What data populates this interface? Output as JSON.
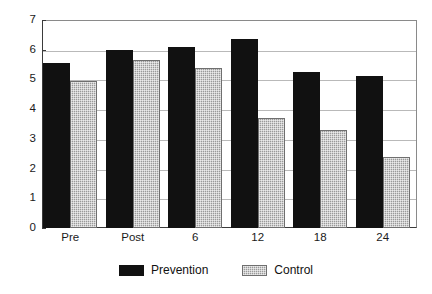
{
  "chart_data": {
    "type": "bar",
    "title": "",
    "subtitle": "",
    "xlabel": "",
    "ylabel": "",
    "categories": [
      "Pre",
      "Post",
      "6",
      "12",
      "18",
      "24"
    ],
    "series": [
      {
        "name": "Prevention",
        "color": "#111111",
        "values": [
          5.55,
          6.0,
          6.1,
          6.35,
          5.25,
          5.1
        ]
      },
      {
        "name": "Control",
        "color": "#9a9a9a",
        "values": [
          4.95,
          5.65,
          5.4,
          3.7,
          3.3,
          2.4
        ]
      }
    ],
    "ylim": [
      0,
      7
    ],
    "yticks": [
      0,
      1,
      2,
      3,
      4,
      5,
      6,
      7
    ],
    "ytick_labels": [
      "0",
      "1",
      "2",
      "3",
      "4",
      "5",
      "6",
      "7"
    ],
    "grid": true,
    "grid_axis": "y",
    "legend_position": "bottom",
    "legend_entries": [
      "Prevention",
      "Control"
    ]
  }
}
